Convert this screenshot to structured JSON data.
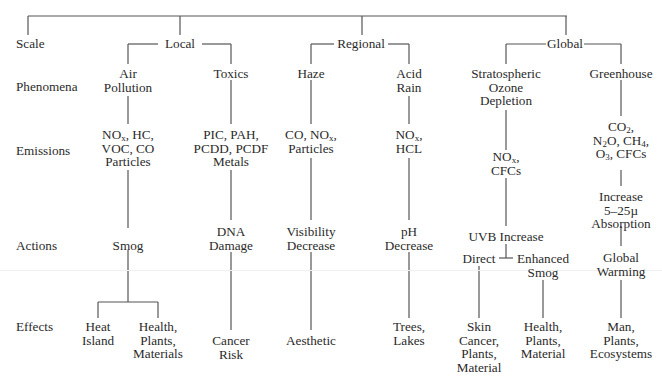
{
  "rows": {
    "scale": "Scale",
    "phenomena": "Phenomena",
    "emissions": "Emissions",
    "actions": "Actions",
    "effects": "Effects"
  },
  "scales": {
    "local": "Local",
    "regional": "Regional",
    "global": "Global"
  },
  "columns": {
    "air_pollution": {
      "phenomenon": [
        "Air",
        "Pollution"
      ],
      "emissions_html": [
        "NO<sub>x</sub>, HC,",
        "VOC, CO",
        "Particles"
      ],
      "action": "Smog",
      "effects": [
        {
          "lines": [
            "Heat",
            "Island"
          ]
        },
        {
          "lines": [
            "Health,",
            "Plants,",
            "Materials"
          ]
        }
      ]
    },
    "toxics": {
      "phenomenon": [
        "Toxics"
      ],
      "emissions_html": [
        "PIC, PAH,",
        "PCDD, PCDF",
        "Metals"
      ],
      "action": [
        "DNA",
        "Damage"
      ],
      "effects": [
        {
          "lines": [
            "Cancer",
            "Risk"
          ]
        }
      ]
    },
    "haze": {
      "phenomenon": [
        "Haze"
      ],
      "emissions_html": [
        "CO, NO<sub>x</sub>,",
        "Particles"
      ],
      "action": [
        "Visibility",
        "Decrease"
      ],
      "effects": [
        {
          "lines": [
            "Aesthetic"
          ]
        }
      ]
    },
    "acid_rain": {
      "phenomenon": [
        "Acid",
        "Rain"
      ],
      "emissions_html": [
        "NO<sub>x</sub>,",
        "HCL"
      ],
      "action": [
        "pH",
        "Decrease"
      ],
      "effects": [
        {
          "lines": [
            "Trees,",
            "Lakes"
          ]
        }
      ]
    },
    "ozone": {
      "phenomenon": [
        "Stratospheric",
        "Ozone",
        "Depletion"
      ],
      "emissions_html": [
        "NO<sub>x</sub>,",
        "CFCs"
      ],
      "action": "UVB Increase",
      "sub_actions": [
        {
          "lines": [
            "Direct"
          ]
        },
        {
          "lines": [
            "Enhanced",
            "Smog"
          ]
        }
      ],
      "effects": [
        {
          "lines": [
            "Skin",
            "Cancer,",
            "Plants,",
            "Material"
          ]
        },
        {
          "lines": [
            "Health,",
            "Plants,",
            "Material"
          ]
        }
      ]
    },
    "greenhouse": {
      "phenomenon": [
        "Greenhouse"
      ],
      "emissions_html": [
        "CO<sub>2</sub>,",
        "N<sub>2</sub>O, CH<sub>4</sub>,",
        "O<sub>3</sub>, CFCs"
      ],
      "action": [
        "Increase",
        "5–25µ",
        "Absorption"
      ],
      "action2": [
        "Global",
        "Warming"
      ],
      "effects": [
        {
          "lines": [
            "Man,",
            "Plants,",
            "Ecosystems"
          ]
        }
      ]
    }
  }
}
